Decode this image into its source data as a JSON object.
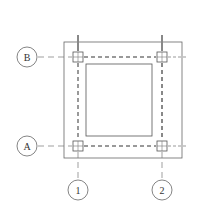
{
  "diagram": {
    "type": "structural-plan",
    "colors": {
      "line": "#555555",
      "dashed": "#8a8a8a",
      "column": "#666666",
      "background": "#ffffff"
    },
    "grid_axes": {
      "rows": [
        {
          "label": "B",
          "y": 57
        },
        {
          "label": "A",
          "y": 146
        }
      ],
      "columns": [
        {
          "label": "1",
          "x": 78
        },
        {
          "label": "2",
          "x": 162
        }
      ]
    },
    "outer_slab": {
      "x": 64,
      "y": 42,
      "width": 118,
      "height": 116
    },
    "inner_opening": {
      "x": 86,
      "y": 64,
      "width": 66,
      "height": 72
    },
    "columns_at_intersections": [
      {
        "id": "B1"
      },
      {
        "id": "B2"
      },
      {
        "id": "A1"
      },
      {
        "id": "A2"
      }
    ]
  }
}
